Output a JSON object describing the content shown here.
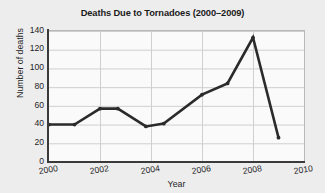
{
  "chart_data": {
    "type": "line",
    "title": "Deaths Due to Tornadoes (2000–2009)",
    "xlabel": "Year",
    "ylabel": "Number of deaths",
    "xlim": [
      2000,
      2010
    ],
    "ylim": [
      0,
      140
    ],
    "grid": true,
    "legend": "none",
    "marker": "circle",
    "line_color": "#2b2b2b",
    "grid_color": "#cfcfcf",
    "background_color": "#eeedee",
    "plot_background_color": "#fafafa",
    "xticks": [
      2000,
      2002,
      2004,
      2006,
      2008,
      2010
    ],
    "xtick_labels": [
      "2000",
      "2002",
      "2004",
      "2006",
      "2008",
      "2010"
    ],
    "yticks": [
      0,
      20,
      40,
      60,
      80,
      100,
      120,
      140
    ],
    "ytick_labels": [
      "0",
      "20",
      "40",
      "60",
      "80",
      "100",
      "120",
      "140"
    ],
    "categories": [
      "2000",
      "2001",
      "2002",
      "2003",
      "2004",
      "2005",
      "2006",
      "2007",
      "2008",
      "2009"
    ],
    "values": [
      40,
      40,
      57,
      38,
      38,
      41,
      72,
      84,
      133,
      26
    ],
    "x": [
      2000.0,
      2001.0,
      2002.0,
      2002.7,
      2003.8,
      2004.5,
      2006.0,
      2007.0,
      2008.0,
      2009.0
    ],
    "y": [
      40,
      40,
      57,
      57,
      38,
      41,
      72,
      84,
      133,
      26
    ],
    "series": [
      {
        "name": "Number of deaths",
        "points": [
          {
            "x": 2000.0,
            "y": 40
          },
          {
            "x": 2001.0,
            "y": 40
          },
          {
            "x": 2002.0,
            "y": 57
          },
          {
            "x": 2002.7,
            "y": 57
          },
          {
            "x": 2003.8,
            "y": 38
          },
          {
            "x": 2004.5,
            "y": 41
          },
          {
            "x": 2006.0,
            "y": 72
          },
          {
            "x": 2007.0,
            "y": 84
          },
          {
            "x": 2008.0,
            "y": 133
          },
          {
            "x": 2009.0,
            "y": 26
          }
        ]
      }
    ]
  }
}
